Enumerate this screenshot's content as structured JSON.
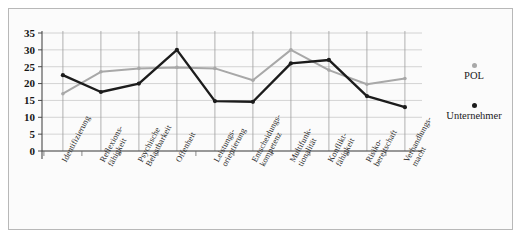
{
  "chart_data": {
    "type": "line",
    "title": "",
    "xlabel": "",
    "ylabel": "",
    "ylim": [
      0,
      35
    ],
    "ytick_step": 5,
    "yticks": [
      0,
      5,
      10,
      15,
      20,
      25,
      30,
      35
    ],
    "grid": true,
    "legend_position": "right",
    "categories": [
      "Identifizierung",
      "Reflexions-\nfähigkeit",
      "Psychische\nBelastbarkeit",
      "Offenheit",
      "Leistungs-\norientierung",
      "Entscheidungs-\nkompetenz",
      "Multifunk-\ntionalität",
      "Konflikt-\nfähigkeit",
      "Risiko-\nbereitschaft",
      "Verhandlungs-\nmacht"
    ],
    "series": [
      {
        "name": "POL",
        "color": "#a8a8a8",
        "values": [
          17,
          23.5,
          24.5,
          24.8,
          24.5,
          21,
          30,
          24,
          19.8,
          21.5
        ]
      },
      {
        "name": "Unternehmer",
        "color": "#1c1c1c",
        "values": [
          22.5,
          17.5,
          20,
          30,
          14.8,
          14.6,
          26,
          27,
          16.3,
          13
        ]
      }
    ]
  },
  "legend": {
    "items": [
      {
        "label": "POL",
        "color": "#a8a8a8",
        "dot": "legend-dot-gray"
      },
      {
        "label": "Unternehmer",
        "color": "#1c1c1c",
        "dot": "legend-dot-black"
      }
    ]
  },
  "axis": {
    "y_labels": [
      "35",
      "30",
      "25",
      "20",
      "15",
      "10",
      "5",
      "0"
    ]
  }
}
